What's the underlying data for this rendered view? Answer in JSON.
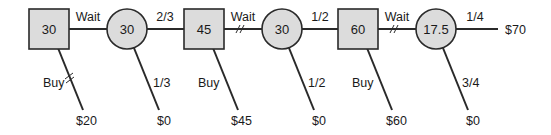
{
  "diagram": {
    "type": "decision-tree",
    "colors": {
      "node_fill": "#dcdcdc",
      "stroke": "#2a2a2a",
      "text": "#1a1a1a",
      "background": "#ffffff"
    },
    "decision_nodes": [
      {
        "id": "d1",
        "value": "30"
      },
      {
        "id": "d2",
        "value": "45"
      },
      {
        "id": "d3",
        "value": "60"
      }
    ],
    "chance_nodes": [
      {
        "id": "c1",
        "value": "30"
      },
      {
        "id": "c2",
        "value": "30"
      },
      {
        "id": "c3",
        "value": "17.5"
      }
    ],
    "horizontal_edges": [
      {
        "from": "d1",
        "to": "c1",
        "label": "Wait",
        "blocked": false
      },
      {
        "from": "c1",
        "to": "d2",
        "label": "2/3",
        "blocked": false
      },
      {
        "from": "d2",
        "to": "c2",
        "label": "Wait",
        "blocked": true
      },
      {
        "from": "c2",
        "to": "d3",
        "label": "1/2",
        "blocked": false
      },
      {
        "from": "d3",
        "to": "c3",
        "label": "Wait",
        "blocked": true
      },
      {
        "from": "c3",
        "to": "end",
        "label": "1/4",
        "blocked": false
      }
    ],
    "terminal_top": {
      "payoff": "$70"
    },
    "down_branches": [
      {
        "from": "d1",
        "label": "Buy",
        "payoff": "$20",
        "blocked": true
      },
      {
        "from": "c1",
        "label": "1/3",
        "payoff": "$0",
        "blocked": false
      },
      {
        "from": "d2",
        "label": "Buy",
        "payoff": "$45",
        "blocked": false
      },
      {
        "from": "c2",
        "label": "1/2",
        "payoff": "$0",
        "blocked": false
      },
      {
        "from": "d3",
        "label": "Buy",
        "payoff": "$60",
        "blocked": false
      },
      {
        "from": "c3",
        "label": "3/4",
        "payoff": "$0",
        "blocked": false
      }
    ]
  }
}
